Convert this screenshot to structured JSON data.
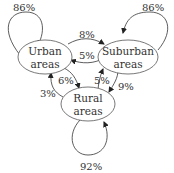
{
  "diagram": {
    "type": "markov-chain",
    "nodes": [
      {
        "id": "urban",
        "line1": "Urban",
        "line2": "areas"
      },
      {
        "id": "suburban",
        "line1": "Suburban",
        "line2": "areas"
      },
      {
        "id": "rural",
        "line1": "Rural",
        "line2": "areas"
      }
    ],
    "edges": [
      {
        "from": "urban",
        "to": "urban",
        "label": "86%"
      },
      {
        "from": "urban",
        "to": "suburban",
        "label": "8%"
      },
      {
        "from": "urban",
        "to": "rural",
        "label": "6%"
      },
      {
        "from": "suburban",
        "to": "suburban",
        "label": "86%"
      },
      {
        "from": "suburban",
        "to": "urban",
        "label": "5%"
      },
      {
        "from": "suburban",
        "to": "rural",
        "label": "9%"
      },
      {
        "from": "rural",
        "to": "rural",
        "label": "92%"
      },
      {
        "from": "rural",
        "to": "urban",
        "label": "3%"
      },
      {
        "from": "rural",
        "to": "suburban",
        "label": "5%"
      }
    ]
  }
}
